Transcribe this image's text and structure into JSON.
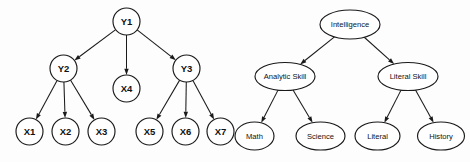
{
  "figure": {
    "background_color": "#fdfdfd",
    "stroke_color": "#1a1a1a",
    "node_fill": "#ffffff"
  },
  "diagrams": [
    {
      "id": "left-diagram",
      "name": "abstract-latent-variable-model",
      "node_shape": "circle",
      "nodes": [
        {
          "id": "Y1",
          "label": "Y1",
          "cx": 126.5,
          "cy": 21.5,
          "r": 13.5
        },
        {
          "id": "Y2",
          "label": "Y2",
          "cx": 63.5,
          "cy": 68.5,
          "r": 13.5
        },
        {
          "id": "X4",
          "label": "X4",
          "cx": 126.5,
          "cy": 88.5,
          "r": 13.5
        },
        {
          "id": "Y3",
          "label": "Y3",
          "cx": 186.5,
          "cy": 68.5,
          "r": 13.5
        },
        {
          "id": "X1",
          "label": "X1",
          "cx": 29.5,
          "cy": 131.5,
          "r": 13.5
        },
        {
          "id": "X2",
          "label": "X2",
          "cx": 65.5,
          "cy": 131.5,
          "r": 13.5
        },
        {
          "id": "X3",
          "label": "X3",
          "cx": 101.5,
          "cy": 131.5,
          "r": 13.5
        },
        {
          "id": "X5",
          "label": "X5",
          "cx": 149.5,
          "cy": 131.5,
          "r": 13.5
        },
        {
          "id": "X6",
          "label": "X6",
          "cx": 185.5,
          "cy": 131.5,
          "r": 13.5
        },
        {
          "id": "X7",
          "label": "X7",
          "cx": 220.5,
          "cy": 131.5,
          "r": 13.5
        }
      ],
      "edges": [
        {
          "from": "Y1",
          "to": "Y2",
          "directed": true
        },
        {
          "from": "Y1",
          "to": "X4",
          "directed": true
        },
        {
          "from": "Y1",
          "to": "Y3",
          "directed": true
        },
        {
          "from": "Y2",
          "to": "X1",
          "directed": true
        },
        {
          "from": "Y2",
          "to": "X2",
          "directed": true
        },
        {
          "from": "Y2",
          "to": "X3",
          "directed": true
        },
        {
          "from": "Y3",
          "to": "X5",
          "directed": true
        },
        {
          "from": "Y3",
          "to": "X6",
          "directed": true
        },
        {
          "from": "Y3",
          "to": "X7",
          "directed": true
        }
      ]
    },
    {
      "id": "right-diagram",
      "name": "intelligence-skill-model",
      "node_shape": "ellipse",
      "nodes": [
        {
          "id": "Intelligence",
          "label": "Intelligence",
          "cx": 350.0,
          "cy": 24.5,
          "rx": 30.0,
          "ry": 14.5
        },
        {
          "id": "AnalyticSkill",
          "label": "Analytic Skill",
          "cx": 285.0,
          "cy": 76.5,
          "rx": 30.0,
          "ry": 14.0
        },
        {
          "id": "LiteralSkill",
          "label": "Literal Skill",
          "cx": 408.0,
          "cy": 76.5,
          "rx": 30.0,
          "ry": 14.0
        },
        {
          "id": "Math",
          "label": "Math",
          "cx": 254.5,
          "cy": 136.0,
          "rx": 19.5,
          "ry": 14.0
        },
        {
          "id": "Science",
          "label": "Science",
          "cx": 320.5,
          "cy": 136.0,
          "rx": 24.5,
          "ry": 14.0
        },
        {
          "id": "Literal",
          "label": "Literal",
          "cx": 377.5,
          "cy": 136.0,
          "rx": 22.5,
          "ry": 14.0
        },
        {
          "id": "History",
          "label": "History",
          "cx": 441.0,
          "cy": 136.0,
          "rx": 23.5,
          "ry": 14.0
        }
      ],
      "edges": [
        {
          "from": "Intelligence",
          "to": "AnalyticSkill",
          "directed": true
        },
        {
          "from": "Intelligence",
          "to": "LiteralSkill",
          "directed": true
        },
        {
          "from": "AnalyticSkill",
          "to": "Math",
          "directed": true
        },
        {
          "from": "AnalyticSkill",
          "to": "Science",
          "directed": true
        },
        {
          "from": "LiteralSkill",
          "to": "Literal",
          "directed": true
        },
        {
          "from": "LiteralSkill",
          "to": "History",
          "directed": true
        }
      ]
    }
  ]
}
